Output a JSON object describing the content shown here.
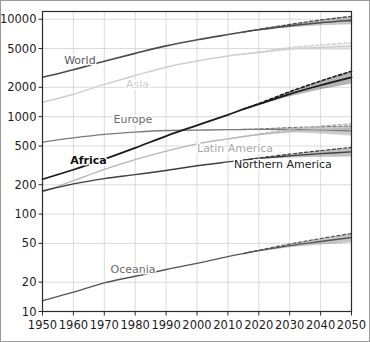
{
  "chart_data": {
    "type": "line",
    "title": "",
    "subtitle": "",
    "xlabel": "",
    "ylabel": "",
    "yscale": "log",
    "xscale": "linear",
    "xlim": [
      1950,
      2050
    ],
    "ylim": [
      10,
      12000
    ],
    "grid": true,
    "legend_position": "inline-labels",
    "units": "millions",
    "x_ticks": [
      1950,
      1960,
      1970,
      1980,
      1990,
      2000,
      2010,
      2020,
      2030,
      2040,
      2050
    ],
    "x_tick_labels": [
      "1950",
      "1960",
      "1970",
      "1980",
      "1990",
      "2000",
      "2010",
      "2020",
      "2030",
      "2040",
      "2050"
    ],
    "y_ticks": [
      10,
      20,
      50,
      100,
      200,
      500,
      1000,
      2000,
      5000,
      10000
    ],
    "y_tick_labels": [
      "10",
      "20",
      "50",
      "100",
      "200",
      "500",
      "1000",
      "2000",
      "5000",
      "10000"
    ],
    "projection_start": 2015,
    "x": [
      1950,
      1960,
      1970,
      1980,
      1990,
      2000,
      2010,
      2015,
      2020,
      2030,
      2040,
      2050
    ],
    "series": [
      {
        "name": "World",
        "label": "World",
        "color": "#4d4d4d",
        "label_color": "#595959",
        "bold": false,
        "width": 1.6,
        "label_x": 1957,
        "label_y": 3450,
        "values": [
          2536,
          3035,
          3700,
          4458,
          5327,
          6143,
          6958,
          7383,
          7795,
          8548,
          9199,
          9735
        ],
        "upper": [
          null,
          null,
          null,
          null,
          null,
          null,
          null,
          7383,
          7870,
          8830,
          9800,
          10700
        ],
        "lower": [
          null,
          null,
          null,
          null,
          null,
          null,
          null,
          7383,
          7730,
          8290,
          8650,
          8900
        ]
      },
      {
        "name": "Asia",
        "label": "Asia",
        "color": "#cfcfcf",
        "label_color": "#cccccc",
        "bold": false,
        "width": 1.5,
        "label_x": 1977,
        "label_y": 1960,
        "values": [
          1404,
          1700,
          2144,
          2642,
          3221,
          3730,
          4194,
          4393,
          4545,
          4947,
          5125,
          5267
        ],
        "upper": [
          null,
          null,
          null,
          null,
          null,
          null,
          null,
          4393,
          4600,
          5120,
          5450,
          5760
        ],
        "lower": [
          null,
          null,
          null,
          null,
          null,
          null,
          null,
          4393,
          4500,
          4790,
          4810,
          4790
        ]
      },
      {
        "name": "Europe",
        "label": "Europe",
        "color": "#7a7a7a",
        "label_color": "#6e6e6e",
        "bold": false,
        "width": 1.3,
        "label_x": 1973,
        "label_y": 860,
        "values": [
          549,
          605,
          657,
          694,
          721,
          726,
          736,
          738,
          741,
          739,
          728,
          716
        ],
        "upper": [
          null,
          null,
          null,
          null,
          null,
          null,
          null,
          738,
          748,
          772,
          789,
          800
        ],
        "lower": [
          null,
          null,
          null,
          null,
          null,
          null,
          null,
          738,
          734,
          708,
          673,
          637
        ]
      },
      {
        "name": "Africa",
        "label": "Africa",
        "color": "#1a1a1a",
        "label_color": "#111111",
        "bold": true,
        "width": 1.8,
        "label_x": 1959,
        "label_y": 330,
        "values": [
          228,
          285,
          366,
          478,
          632,
          814,
          1044,
          1194,
          1341,
          1704,
          2100,
          2528
        ],
        "upper": [
          null,
          null,
          null,
          null,
          null,
          null,
          null,
          1194,
          1360,
          1800,
          2320,
          2920
        ],
        "lower": [
          null,
          null,
          null,
          null,
          null,
          null,
          null,
          1194,
          1325,
          1615,
          1905,
          2190
        ]
      },
      {
        "name": "Latin America",
        "label": "Latin America",
        "color": "#b5b5b5",
        "label_color": "#a8a8a8",
        "bold": false,
        "width": 1.4,
        "label_x": 2000,
        "label_y": 430,
        "values": [
          169,
          220,
          287,
          362,
          443,
          526,
          591,
          625,
          654,
          706,
          735,
          750
        ],
        "upper": [
          null,
          null,
          null,
          null,
          null,
          null,
          null,
          625,
          662,
          738,
          800,
          845
        ],
        "lower": [
          null,
          null,
          null,
          null,
          null,
          null,
          null,
          625,
          647,
          675,
          676,
          665
        ]
      },
      {
        "name": "Northern America",
        "label": "Northern America",
        "color": "#3d3d3d",
        "label_color": "#222222",
        "bold": false,
        "width": 1.4,
        "label_x": 2012,
        "label_y": 300,
        "values": [
          173,
          204,
          231,
          254,
          280,
          313,
          343,
          358,
          373,
          396,
          417,
          435
        ],
        "upper": [
          null,
          null,
          null,
          null,
          null,
          null,
          null,
          358,
          377,
          412,
          448,
          483
        ],
        "lower": [
          null,
          null,
          null,
          null,
          null,
          null,
          null,
          358,
          369,
          381,
          388,
          391
        ]
      },
      {
        "name": "Oceania",
        "label": "Oceania",
        "color": "#555555",
        "label_color": "#6a6a6a",
        "bold": false,
        "width": 1.4,
        "label_x": 1972,
        "label_y": 25,
        "values": [
          12.9,
          15.8,
          19.7,
          23.0,
          27.0,
          31.2,
          36.6,
          39.3,
          42.1,
          47.4,
          52.3,
          57.4
        ],
        "upper": [
          null,
          null,
          null,
          null,
          null,
          null,
          null,
          39.3,
          42.6,
          49.2,
          56.1,
          63.2
        ],
        "lower": [
          null,
          null,
          null,
          null,
          null,
          null,
          null,
          39.3,
          41.6,
          45.6,
          48.6,
          51.5
        ]
      }
    ]
  },
  "figure": {
    "background_color": "#ffffff",
    "frame_color": "#9a9a9a",
    "grid_color": "#d0d0d0",
    "axis_color": "#2b2b2b"
  }
}
